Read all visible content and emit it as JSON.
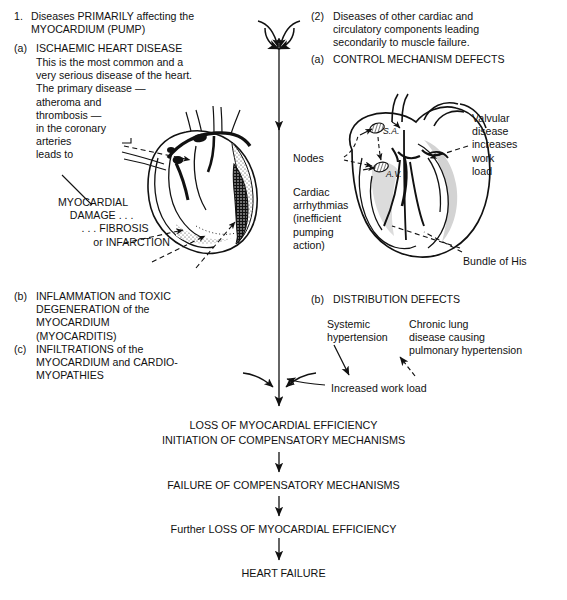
{
  "diagram": {
    "background": "#ffffff",
    "ink": "#111111"
  },
  "branch_one": {
    "marker": "1.",
    "heading": "Diseases PRIMARILY affecting the\nMYOCARDIUM (PUMP)",
    "item_a_marker": "(a)",
    "item_a_title": "ISCHAEMIC HEART DISEASE",
    "item_a_body": "This is the most common and a\nvery serious disease of the heart.\nThe primary disease —\natheroma and\nthrombosis —\nin the coronary\narteries\nleads to",
    "outcome": "MYOCARDIAL\n    DAMAGE . . .\n        . . . FIBROSIS\n            or INFARCTION",
    "item_b_marker": "(b)",
    "item_b_text": "INFLAMMATION and TOXIC\nDEGENERATION of the\nMYOCARDIUM\n(MYOCARDITIS)",
    "item_c_marker": "(c)",
    "item_c_text": "INFILTRATIONS of the\nMYOCARDIUM and CARDIO-\nMYOPATHIES"
  },
  "branch_two": {
    "marker": "(2)",
    "heading": "Diseases of other cardiac and\ncirculatory components leading\nsecondarily to muscle failure.",
    "item_a_marker": "(a)",
    "item_a_title": "CONTROL MECHANISM DEFECTS",
    "item_b_marker": "(b)",
    "item_b_title": "DISTRIBUTION DEFECTS"
  },
  "heart_labels": {
    "nodes": "Nodes",
    "sa_node": "S.A.",
    "av_node": "A.V.",
    "arrhythmias": "Cardiac\narrhythmias\n(inefficient\npumping\naction)",
    "valvular": "Valvular\ndisease\nincreases\nwork\nload",
    "bundle_of_his": "Bundle of His"
  },
  "distribution": {
    "systemic": "Systemic\nhypertension",
    "chronic_lung": "Chronic lung\ndisease causing\npulmonary hypertension",
    "increased_work_load": "Increased work load"
  },
  "cascade": {
    "step1": "LOSS OF MYOCARDIAL EFFICIENCY\nINITIATION OF COMPENSATORY MECHANISMS",
    "step2": "FAILURE OF COMPENSATORY MECHANISMS",
    "step3": "Further LOSS OF MYOCARDIAL EFFICIENCY",
    "step4": "HEART FAILURE"
  }
}
